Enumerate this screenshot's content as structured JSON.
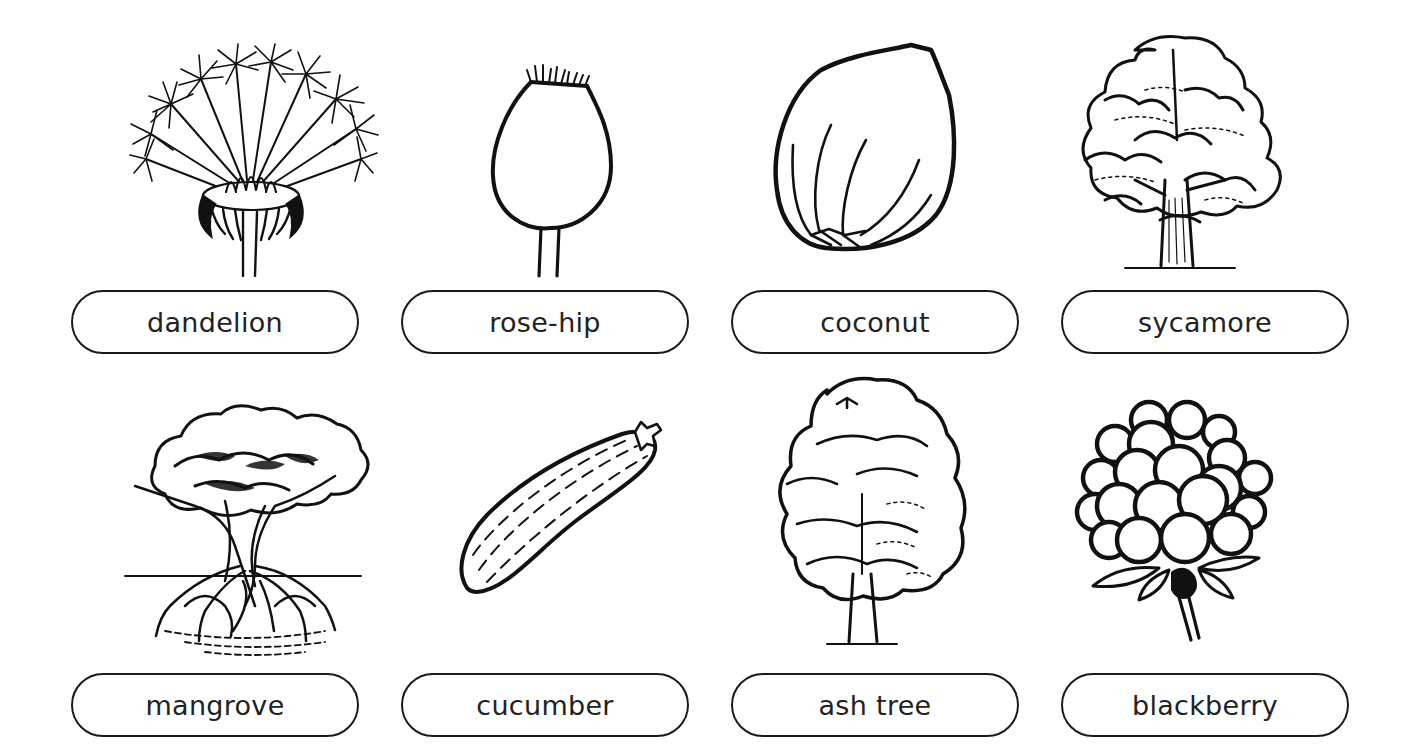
{
  "worksheet": {
    "items": [
      {
        "label": "dandelion",
        "icon": "dandelion-icon"
      },
      {
        "label": "rose-hip",
        "icon": "rose-hip-icon"
      },
      {
        "label": "coconut",
        "icon": "coconut-icon"
      },
      {
        "label": "sycamore",
        "icon": "sycamore-tree-icon"
      },
      {
        "label": "mangrove",
        "icon": "mangrove-tree-icon"
      },
      {
        "label": "cucumber",
        "icon": "cucumber-icon"
      },
      {
        "label": "ash tree",
        "icon": "ash-tree-icon"
      },
      {
        "label": "blackberry",
        "icon": "blackberry-icon"
      }
    ]
  }
}
